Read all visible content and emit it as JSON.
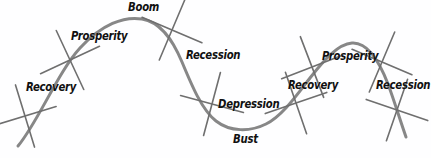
{
  "diagram": {
    "background_color": "#fefeff",
    "curve_color": "#878787",
    "tick_color": "#6f6f6f",
    "label_color": "#111111",
    "phases": [
      {
        "key": "recovery_1",
        "label": "Recovery",
        "x": 26,
        "y": 82,
        "cycle": 1,
        "limb": "rising"
      },
      {
        "key": "prosperity_1",
        "label": "Prosperity",
        "x": 71,
        "y": 31,
        "cycle": 1,
        "limb": "rising"
      },
      {
        "key": "boom_1",
        "label": "Boom",
        "x": 128,
        "y": 2,
        "cycle": 1,
        "limb": "peak"
      },
      {
        "key": "recession_1",
        "label": "Recession",
        "x": 186,
        "y": 50,
        "cycle": 1,
        "limb": "falling"
      },
      {
        "key": "depression_1",
        "label": "Depression",
        "x": 218,
        "y": 99,
        "cycle": 1,
        "limb": "falling"
      },
      {
        "key": "bust_1",
        "label": "Bust",
        "x": 233,
        "y": 134,
        "cycle": 1,
        "limb": "trough"
      },
      {
        "key": "recovery_2",
        "label": "Recovery",
        "x": 288,
        "y": 80,
        "cycle": 2,
        "limb": "rising"
      },
      {
        "key": "prosperity_2",
        "label": "Prosperity",
        "x": 322,
        "y": 51,
        "cycle": 2,
        "limb": "rising"
      },
      {
        "key": "recession_2",
        "label": "Recession",
        "x": 376,
        "y": 80,
        "cycle": 2,
        "limb": "falling"
      }
    ],
    "curve": {
      "type": "wave",
      "stroke_width": 3,
      "path": "M 18 146 C 38 122 58 72 80 48 C 102 24 124 16 142 19 C 160 22 172 38 182 62 C 192 86 202 110 216 121 C 230 132 250 132 266 124 C 282 116 296 96 310 78 C 324 60 338 44 352 43 C 366 42 378 58 388 84 C 394 100 400 120 406 137"
    },
    "tick_marks": [
      {
        "key": "tick-1",
        "cx": 25,
        "cy": 116,
        "angle": 28
      },
      {
        "key": "tick-2",
        "cx": 70,
        "cy": 60,
        "angle": 20
      },
      {
        "key": "tick-3",
        "cx": 172,
        "cy": 30,
        "angle": -22
      },
      {
        "key": "tick-4",
        "cx": 212,
        "cy": 104,
        "angle": -30
      },
      {
        "key": "tick-5",
        "cx": 296,
        "cy": 103,
        "angle": 26
      },
      {
        "key": "tick-6",
        "cx": 312,
        "cy": 67,
        "angle": 24
      },
      {
        "key": "tick-7",
        "cx": 382,
        "cy": 62,
        "angle": -22
      },
      {
        "key": "tick-8",
        "cx": 397,
        "cy": 110,
        "angle": -26
      }
    ],
    "tick_half_length": 23
  }
}
